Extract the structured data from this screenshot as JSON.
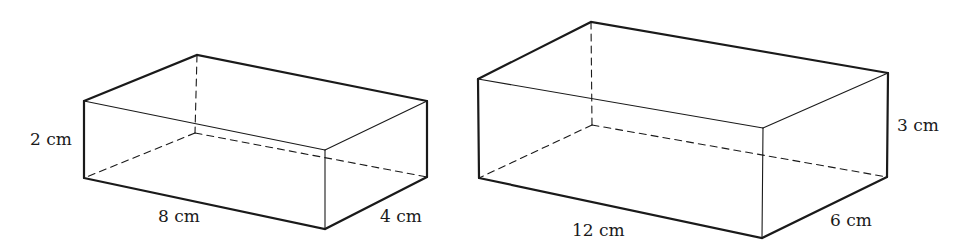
{
  "diagram": {
    "type": "rectangular-prisms",
    "boxes": [
      {
        "id": "small-box",
        "labels": {
          "height": "2 cm",
          "length": "8 cm",
          "width": "4 cm"
        },
        "vertices": {
          "tlf": [
            84,
            101
          ],
          "tbl": [
            197,
            55
          ],
          "trb": [
            427,
            101
          ],
          "tfr": [
            325,
            150
          ],
          "blf": [
            84,
            178
          ],
          "bfr": [
            325,
            229
          ],
          "brb": [
            427,
            177
          ],
          "bbl": [
            195,
            133
          ]
        }
      },
      {
        "id": "large-box",
        "labels": {
          "height": "3 cm",
          "length": "12 cm",
          "width": "6 cm"
        },
        "vertices": {
          "tlf": [
            478,
            79
          ],
          "tbl": [
            591,
            22
          ],
          "trb": [
            888,
            73
          ],
          "tfr": [
            763,
            128
          ],
          "blf": [
            479,
            178
          ],
          "bfr": [
            762,
            238
          ],
          "brb": [
            887,
            177
          ],
          "bbl": [
            592,
            125
          ]
        }
      }
    ]
  }
}
